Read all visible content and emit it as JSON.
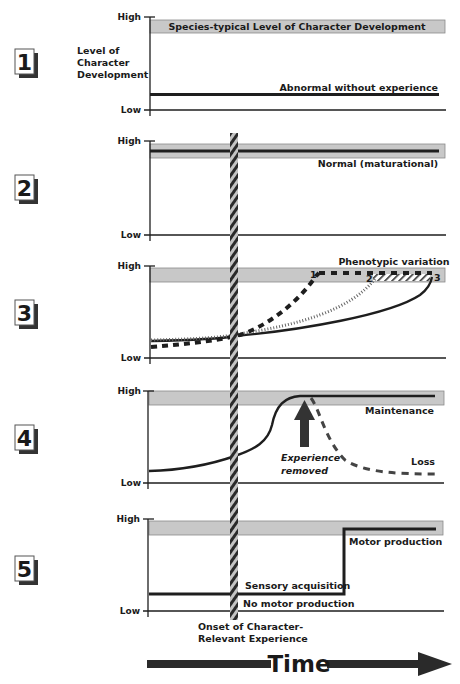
{
  "axis": {
    "high_label": "High",
    "low_label": "Low",
    "y_title_line1": "Level of",
    "y_title_line2": "Character",
    "y_title_line3": "Development"
  },
  "band_label": "Species-typical Level of Character Development",
  "panels": [
    {
      "number": "1",
      "labels": {
        "line": "Abnormal without experience"
      }
    },
    {
      "number": "2",
      "labels": {
        "line": "Normal (maturational)"
      }
    },
    {
      "number": "3",
      "labels": {
        "title": "Phenotypic variation",
        "m1": "1",
        "m2": "2",
        "m3": "3"
      }
    },
    {
      "number": "4",
      "labels": {
        "maintenance": "Maintenance",
        "loss": "Loss",
        "arrow_line1": "Experience",
        "arrow_line2": "removed"
      }
    },
    {
      "number": "5",
      "labels": {
        "motor": "Motor production",
        "sensory": "Sensory acquisition",
        "no_motor": "No motor production"
      }
    }
  ],
  "onset": {
    "line1": "Onset of Character-",
    "line2": "Relevant Experience"
  },
  "time_label": "Time",
  "colors": {
    "band_fill": "#c8c8c8",
    "band_stroke": "#8a8a8a",
    "line": "#1e1e1e",
    "hatch_light": "#bdbdbd"
  }
}
